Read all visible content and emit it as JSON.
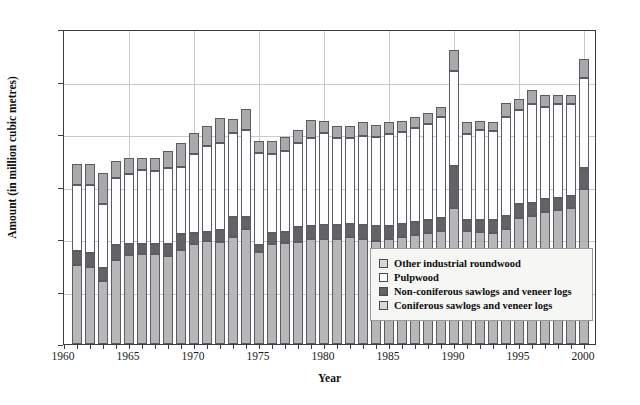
{
  "chart_data": {
    "type": "bar",
    "stacked": true,
    "title": "",
    "xlabel": "Year",
    "ylabel": "Amount (in million cubic metres)",
    "ylim": [
      0,
      300
    ],
    "yticks": [
      0,
      50,
      100,
      150,
      200,
      250,
      300
    ],
    "xlim": [
      1960,
      2000
    ],
    "xticks": [
      1960,
      1965,
      1970,
      1975,
      1980,
      1985,
      1990,
      1995,
      2000
    ],
    "grid": true,
    "legend_position": "inside-lower-right",
    "categories": [
      1961,
      1962,
      1963,
      1964,
      1965,
      1966,
      1967,
      1968,
      1969,
      1970,
      1971,
      1972,
      1973,
      1974,
      1975,
      1976,
      1977,
      1978,
      1979,
      1980,
      1981,
      1982,
      1983,
      1984,
      1985,
      1986,
      1987,
      1988,
      1989,
      1990,
      1991,
      1992,
      1993,
      1994,
      1995,
      1996,
      1997,
      1998,
      1999,
      2000
    ],
    "series": [
      {
        "name": "Coniferous sawlogs and veneer logs",
        "color": "#b7b7b7",
        "values": [
          75,
          73,
          60,
          80,
          85,
          86,
          86,
          84,
          90,
          95,
          98,
          97,
          102,
          110,
          88,
          95,
          96,
          97,
          100,
          100,
          100,
          102,
          100,
          98,
          100,
          102,
          104,
          106,
          108,
          130,
          108,
          107,
          106,
          110,
          120,
          122,
          126,
          128,
          130,
          148
        ]
      },
      {
        "name": "Non-coniferous sawlogs and veneer logs",
        "color": "#636363",
        "values": [
          14,
          14,
          12,
          14,
          10,
          9,
          9,
          11,
          15,
          11,
          9,
          12,
          19,
          11,
          6,
          11,
          11,
          14,
          12,
          13,
          13,
          12,
          13,
          14,
          12,
          12,
          12,
          12,
          12,
          40,
          10,
          11,
          12,
          12,
          13,
          12,
          12,
          11,
          11,
          20
        ]
      },
      {
        "name": "Pulpwood",
        "color": "#fdfdfd",
        "values": [
          62,
          64,
          61,
          64,
          67,
          71,
          70,
          73,
          64,
          75,
          82,
          82,
          80,
          83,
          88,
          75,
          77,
          80,
          84,
          88,
          83,
          82,
          85,
          85,
          88,
          88,
          90,
          92,
          96,
          90,
          82,
          86,
          85,
          94,
          90,
          95,
          88,
          90,
          88,
          85
        ]
      },
      {
        "name": "Other industrial roundwood",
        "color": "#a9a9a9",
        "values": [
          20,
          20,
          30,
          16,
          15,
          11,
          12,
          16,
          22,
          20,
          19,
          24,
          13,
          20,
          11,
          12,
          13,
          13,
          17,
          11,
          12,
          12,
          13,
          12,
          11,
          10,
          10,
          10,
          10,
          20,
          11,
          8,
          8,
          14,
          10,
          13,
          11,
          8,
          8,
          18
        ]
      }
    ]
  },
  "axes": {
    "y_tick_labels": [
      "0",
      "50",
      "100",
      "150",
      "200",
      "250",
      "300"
    ],
    "x_tick_labels": [
      "1960",
      "1965",
      "1970",
      "1975",
      "1980",
      "1985",
      "1990",
      "1995",
      "2000"
    ],
    "y_axis_title": "Amount (in million cubic metres)",
    "x_axis_title": "Year"
  },
  "legend": {
    "items": [
      {
        "label": "Other industrial roundwood",
        "swatch": "legend-swatch-other"
      },
      {
        "label": "Pulpwood",
        "swatch": "legend-swatch-pulpwood"
      },
      {
        "label": "Non-coniferous sawlogs and veneer logs",
        "swatch": "legend-swatch-non-coniferous"
      },
      {
        "label": "Coniferous sawlogs and veneer logs",
        "swatch": "legend-swatch-coniferous"
      }
    ]
  }
}
